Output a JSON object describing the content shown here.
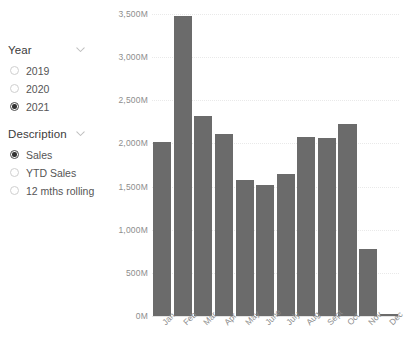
{
  "filters": {
    "year_slicer": {
      "title": "Year",
      "expand_icon": "chevron-down-icon",
      "options": [
        {
          "label": "2019",
          "selected": false
        },
        {
          "label": "2020",
          "selected": false
        },
        {
          "label": "2021",
          "selected": true
        }
      ]
    },
    "description_slicer": {
      "title": "Description",
      "expand_icon": "chevron-down-icon",
      "options": [
        {
          "label": "Sales",
          "selected": true
        },
        {
          "label": "YTD Sales",
          "selected": false
        },
        {
          "label": "12 mths rolling",
          "selected": false
        }
      ]
    }
  },
  "colors": {
    "bar": "#6b6b6b",
    "gridline": "#e9e9e9",
    "axis_text": "#8d8d8d",
    "slicer_title": "#3b3b3b",
    "radio_selected": "#333333"
  },
  "chart_data": {
    "type": "bar",
    "title": "",
    "xlabel": "",
    "ylabel": "",
    "categories": [
      "Jan",
      "Feb",
      "Mar",
      "Apr",
      "May",
      "June",
      "July",
      "Aug",
      "Sept",
      "Oct",
      "Nov",
      "Dec"
    ],
    "values": [
      2020,
      3480,
      2320,
      2110,
      1580,
      1520,
      1650,
      2080,
      2060,
      2230,
      780,
      20
    ],
    "value_unit": "M",
    "ylim": [
      0,
      3500
    ],
    "yticks": [
      0,
      500,
      1000,
      1500,
      2000,
      2500,
      3000,
      3500
    ],
    "ytick_labels": [
      "0M",
      "500M",
      "1,000M",
      "1,500M",
      "2,000M",
      "2,500M",
      "3,000M",
      "3,500M"
    ],
    "grid": true,
    "legend": "none",
    "series": [
      {
        "name": "Sales",
        "values": [
          2020,
          3480,
          2320,
          2110,
          1580,
          1520,
          1650,
          2080,
          2060,
          2230,
          780,
          20
        ]
      }
    ]
  }
}
